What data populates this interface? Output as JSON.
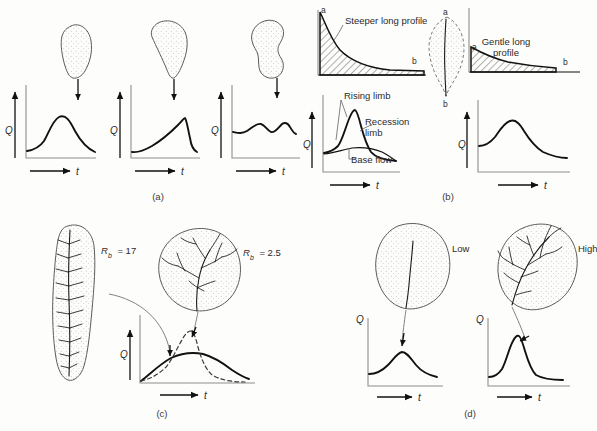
{
  "figure": {
    "background_color": "#fdfdfb",
    "ink_color": "#1a1a1a",
    "axis_color": "#8e8e8e",
    "panels": [
      {
        "id": "a",
        "caption": "(a)",
        "theme": "basin-shape",
        "charts": [
          {
            "name": "pear-basin-hydrograph",
            "y_label": "Q",
            "x_label": "t",
            "basin_shape": "pear",
            "peak_description": "single broad early peak"
          },
          {
            "name": "wide-top-basin-hydrograph",
            "y_label": "Q",
            "x_label": "t",
            "basin_shape": "wide-top-triangular",
            "peak_description": "slow rise to late sharp peak"
          },
          {
            "name": "dumbbell-basin-hydrograph",
            "y_label": "Q",
            "x_label": "t",
            "basin_shape": "dumbbell",
            "peak_description": "double low peak"
          }
        ]
      },
      {
        "id": "b",
        "caption": "(b)",
        "theme": "long-profile",
        "profiles": [
          {
            "name": "steeper-long-profile",
            "label": "Steeper long profile",
            "start_point": "a",
            "end_point": "b"
          },
          {
            "name": "gentle-long-profile",
            "label": "Gentle long profile",
            "start_point": "a",
            "end_point": "b"
          }
        ],
        "basin": {
          "name": "central-basin",
          "top_point": "a",
          "bottom_point": "b"
        },
        "charts": [
          {
            "name": "steep-profile-hydrograph",
            "y_label": "Q",
            "x_label": "t",
            "annotations": [
              {
                "name": "rising-limb-label",
                "text": "Rising limb"
              },
              {
                "name": "recession-limb-label",
                "text": "Recession limb"
              },
              {
                "name": "base-flow-label",
                "text": "Base flow"
              }
            ],
            "peak_description": "tall sharp peak"
          },
          {
            "name": "gentle-profile-hydrograph",
            "y_label": "Q",
            "x_label": "t",
            "peak_description": "lower rounded peak"
          }
        ]
      },
      {
        "id": "c",
        "caption": "(c)",
        "theme": "bifurcation-ratio",
        "basins": [
          {
            "name": "elongate-basin",
            "label_symbol": "R",
            "label_subscript": "b",
            "label_value": "= 17",
            "shape": "elongate",
            "curve_style": "solid"
          },
          {
            "name": "round-basin",
            "label_symbol": "R",
            "label_subscript": "b",
            "label_value": "= 2.5",
            "shape": "round-compact",
            "curve_style": "dashed"
          }
        ],
        "chart": {
          "name": "bifurcation-hydrograph",
          "y_label": "Q",
          "x_label": "t",
          "series": [
            {
              "name": "rb-17-curve",
              "style": "solid",
              "peak_description": "broad low peak"
            },
            {
              "name": "rb-2.5-curve",
              "style": "dashed",
              "peak_description": "tall narrow peak"
            }
          ]
        }
      },
      {
        "id": "d",
        "caption": "(d)",
        "theme": "drainage-density",
        "basins": [
          {
            "name": "low-density-basin",
            "label": "Low",
            "channel_count": "single trunk"
          },
          {
            "name": "high-density-basin",
            "label": "High",
            "channel_count": "dense dendritic network"
          }
        ],
        "charts": [
          {
            "name": "low-density-hydrograph",
            "y_label": "Q",
            "x_label": "t",
            "peak_description": "low rounded peak"
          },
          {
            "name": "high-density-hydrograph",
            "y_label": "Q",
            "x_label": "t",
            "peak_description": "tall sharp peak"
          }
        ]
      }
    ]
  }
}
